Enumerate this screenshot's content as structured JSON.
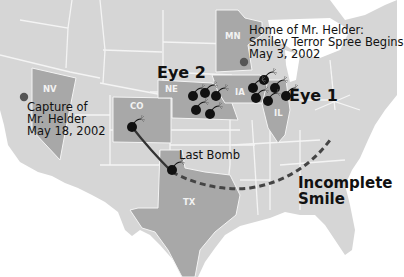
{
  "map": {
    "title": "Smiley Terror Spree Map",
    "colors": {
      "background": "#ffffff",
      "land": "#d6d6d6",
      "highlight_state": "#a8a8a8",
      "borders": "#f4f4f4",
      "bomb": "#111111",
      "path": "#333333",
      "dashed": "#444444"
    },
    "states_highlighted": [
      {
        "code": "NV"
      },
      {
        "code": "CO"
      },
      {
        "code": "NE"
      },
      {
        "code": "MN"
      },
      {
        "code": "IA"
      },
      {
        "code": "IL"
      },
      {
        "code": "TX"
      }
    ],
    "labels": {
      "capture": [
        "Capture of",
        "Mr. Helder",
        "May 18, 2002"
      ],
      "home": [
        "Home of Mr. Helder:",
        "Smiley Terror Spree Begins",
        "May 3, 2002"
      ],
      "eye2": "Eye 2",
      "eye1": "Eye 1",
      "last_bomb": "Last Bomb",
      "incomplete": [
        "Incomplete",
        "Smile"
      ]
    },
    "markers": {
      "eye2_bombs": 5,
      "eye1_bombs": 6,
      "co_bomb": 1,
      "tx_bomb": 1,
      "dots": [
        "capture-location",
        "home-location"
      ]
    }
  }
}
